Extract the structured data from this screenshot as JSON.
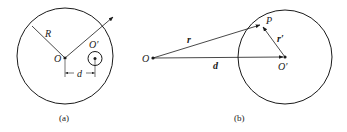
{
  "figure_a": {
    "caption": "(a)",
    "labels": {
      "radius": "R",
      "center": "O",
      "offset_center": "O′",
      "distance": "d"
    }
  },
  "figure_b": {
    "caption": "(b)",
    "labels": {
      "origin": "O",
      "point": "P",
      "position_vector": "r",
      "relative_vector": "r′",
      "displacement": "d",
      "center": "O′"
    }
  },
  "colors": {
    "stroke": "#1a1a1a",
    "background": "#ffffff"
  }
}
